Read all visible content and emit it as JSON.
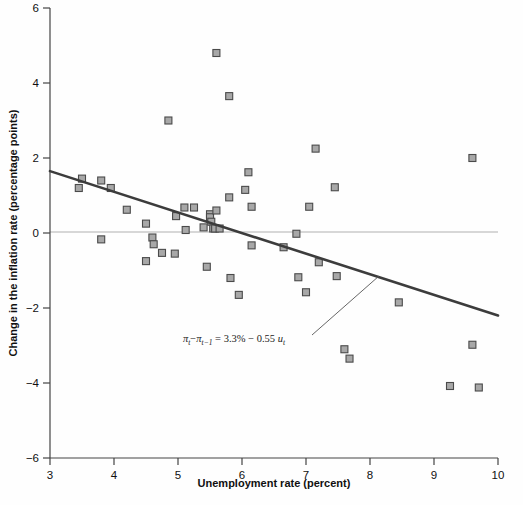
{
  "chart_data": {
    "type": "scatter",
    "title": "",
    "xlabel": "Unemployment rate (percent)",
    "ylabel": "Change in the inflation rate (percentage points)",
    "xlim": [
      3,
      10
    ],
    "ylim": [
      -6,
      6
    ],
    "xticks": [
      "3",
      "4",
      "5",
      "6",
      "7",
      "8",
      "9",
      "10"
    ],
    "yticks": [
      "6",
      "4",
      "2",
      "0",
      "-2",
      "-4",
      "-6"
    ],
    "grid": false,
    "legend": "none",
    "zero_line": 0,
    "marker": {
      "shape": "square",
      "fill": "#a8a8a8",
      "stroke": "#4a4a4a",
      "size": 7
    },
    "series": [
      {
        "name": "Change in inflation vs unemployment",
        "points": [
          [
            3.45,
            1.2
          ],
          [
            3.5,
            1.45
          ],
          [
            3.8,
            1.4
          ],
          [
            3.8,
            -0.17
          ],
          [
            3.95,
            1.2
          ],
          [
            4.2,
            0.62
          ],
          [
            4.5,
            0.25
          ],
          [
            4.5,
            -0.75
          ],
          [
            4.6,
            -0.12
          ],
          [
            4.62,
            -0.3
          ],
          [
            4.75,
            -0.53
          ],
          [
            4.85,
            3.0
          ],
          [
            4.95,
            -0.55
          ],
          [
            4.97,
            0.45
          ],
          [
            5.1,
            0.68
          ],
          [
            5.12,
            0.08
          ],
          [
            5.25,
            0.68
          ],
          [
            5.4,
            0.15
          ],
          [
            5.45,
            -0.9
          ],
          [
            5.5,
            0.5
          ],
          [
            5.5,
            0.42
          ],
          [
            5.52,
            0.3
          ],
          [
            5.55,
            0.12
          ],
          [
            5.58,
            0.12
          ],
          [
            5.6,
            0.6
          ],
          [
            5.6,
            4.8
          ],
          [
            5.65,
            0.12
          ],
          [
            5.8,
            0.95
          ],
          [
            5.8,
            3.65
          ],
          [
            5.82,
            -1.2
          ],
          [
            5.95,
            -1.65
          ],
          [
            6.05,
            1.15
          ],
          [
            6.1,
            1.62
          ],
          [
            6.15,
            0.7
          ],
          [
            6.15,
            -0.33
          ],
          [
            6.65,
            -0.38
          ],
          [
            6.85,
            -0.02
          ],
          [
            6.88,
            -1.18
          ],
          [
            7.0,
            -1.58
          ],
          [
            7.05,
            0.7
          ],
          [
            7.15,
            2.25
          ],
          [
            7.2,
            -0.78
          ],
          [
            7.45,
            1.22
          ],
          [
            7.48,
            -1.15
          ],
          [
            7.6,
            -3.1
          ],
          [
            7.68,
            -3.35
          ],
          [
            8.45,
            -1.85
          ],
          [
            9.25,
            -4.08
          ],
          [
            9.6,
            2.0
          ],
          [
            9.6,
            -2.98
          ],
          [
            9.7,
            -4.12
          ]
        ]
      }
    ],
    "fit_line": {
      "label": "regression line",
      "intercept": 3.3,
      "slope": -0.55,
      "x_start": 3,
      "y_start": 1.65,
      "x_end": 10,
      "y_end": -2.2,
      "color": "#3c3c3c"
    },
    "annotation": {
      "name": "regression-equation",
      "pi_t": "π",
      "sub_t": "t",
      "minus": "−",
      "sub_t_minus_1": "t−1",
      "equals": "=",
      "intercept_text": "3.3%",
      "slope_text": "0.55",
      "u_symbol": "u",
      "full_text": "πt−πt−1 = 3.3% − 0.55 ut",
      "leader_line": {
        "from_x": 312,
        "from_y": 335,
        "to_x": 379,
        "to_y": 276
      }
    }
  },
  "axes": {
    "x_label": "Unemployment rate (percent)",
    "y_label": "Change in the inflation rate (percentage points)"
  }
}
